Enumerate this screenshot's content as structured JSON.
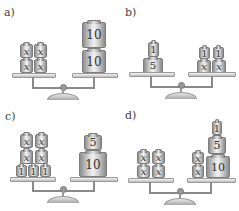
{
  "panels": [
    {
      "id": "a",
      "label": "a)",
      "left": [
        [
          "x",
          "x"
        ],
        [
          "x",
          "x"
        ]
      ],
      "right": [
        "10",
        "10"
      ],
      "equation": "4x = 20"
    },
    {
      "id": "b",
      "label": "b)",
      "left": [
        "1",
        "5"
      ],
      "right": [
        [
          "1",
          "1"
        ],
        [
          "x",
          "x"
        ]
      ],
      "equation": "6 = 2x + 2"
    },
    {
      "id": "c",
      "label": "c)",
      "left": [
        [
          "x",
          "x"
        ],
        [
          "x",
          "x"
        ],
        [
          "1",
          "1",
          "1"
        ]
      ],
      "right": [
        "5",
        "10"
      ],
      "equation": "4x + 3 = 15"
    },
    {
      "id": "d",
      "label": "d)",
      "left": [
        [
          "x",
          "x"
        ],
        [
          "x",
          "x"
        ]
      ],
      "right": {
        "stack_x": [
          "x",
          "x"
        ],
        "stack_num": [
          "1",
          "5",
          "10"
        ]
      },
      "equation": "4x = 2x + 16"
    }
  ],
  "w": {
    "x": "x",
    "one": "1",
    "five": "5",
    "ten": "10"
  },
  "colors": {
    "weight_light": "#f2f2f2",
    "weight_dark": "#8a8a8a",
    "text": "#333333",
    "background": "#ffffff"
  }
}
